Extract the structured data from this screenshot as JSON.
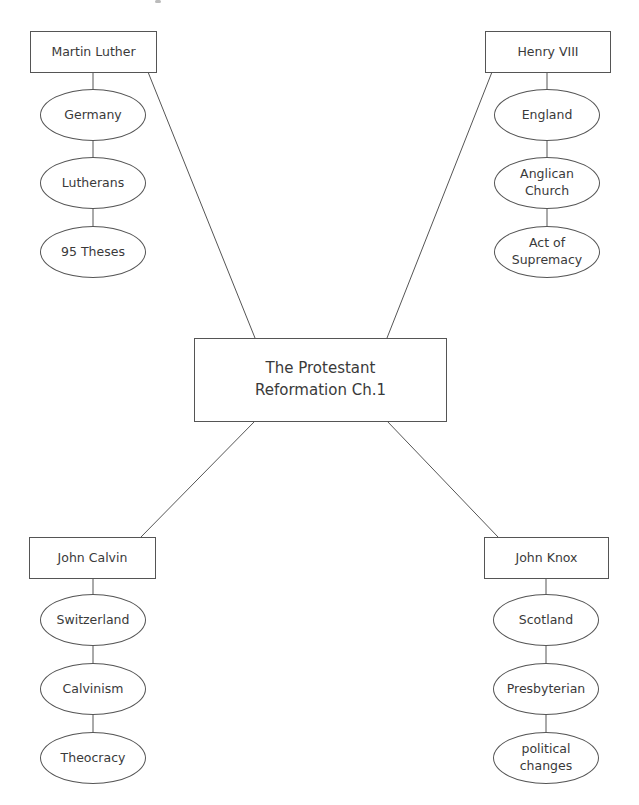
{
  "diagram": {
    "type": "concept-map",
    "central_topic": "The Protestant\nReformation Ch.1",
    "branches": [
      {
        "id": "luther",
        "name": "Martin Luther",
        "position": "top-left",
        "details": [
          "Germany",
          "Lutherans",
          "95 Theses"
        ]
      },
      {
        "id": "henry",
        "name": "Henry VIII",
        "position": "top-right",
        "details": [
          "England",
          "Anglican\nChurch",
          "Act of\nSupremacy"
        ]
      },
      {
        "id": "calvin",
        "name": "John Calvin",
        "position": "bottom-left",
        "details": [
          "Switzerland",
          "Calvinism",
          "Theocracy"
        ]
      },
      {
        "id": "knox",
        "name": "John Knox",
        "position": "bottom-right",
        "details": [
          "Scotland",
          "Presbyterian",
          "political\nchanges"
        ]
      }
    ],
    "colors": {
      "line": "#555555",
      "text": "#3a3a3a",
      "background": "#ffffff"
    }
  }
}
